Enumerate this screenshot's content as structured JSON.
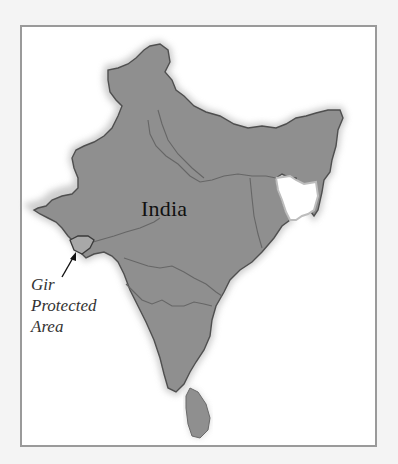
{
  "map": {
    "region": "India",
    "country_label": "India",
    "annotations": [
      {
        "lines": [
          "Gir",
          "Protected",
          "Area"
        ],
        "points_to": "Gir Protected Area"
      }
    ],
    "colors": {
      "background": "#f4f4f4",
      "frame_fill": "#ffffff",
      "frame_border": "#9a9a9a",
      "land": "#8f8f8f",
      "land_outline": "#555555",
      "halo": "#cfcfcf",
      "river": "#6a6a6a",
      "protected_area": "#a4a4a4"
    }
  }
}
